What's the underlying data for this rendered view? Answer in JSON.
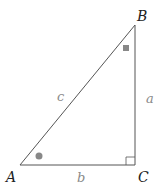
{
  "diagram": {
    "type": "right-triangle",
    "vertices": {
      "A": {
        "label": "A",
        "x": 20,
        "y": 165
      },
      "B": {
        "label": "B",
        "x": 135,
        "y": 25
      },
      "C": {
        "label": "C",
        "x": 135,
        "y": 165
      }
    },
    "sides": {
      "a": {
        "label": "a"
      },
      "b": {
        "label": "b"
      },
      "c": {
        "label": "c"
      }
    },
    "angle_markers": {
      "A": "circle",
      "B": "square",
      "C": "right-angle"
    },
    "colors": {
      "line": "#555555",
      "marker": "#888888",
      "vertex_text": "#222222",
      "side_text": "#8a8a8a"
    }
  }
}
